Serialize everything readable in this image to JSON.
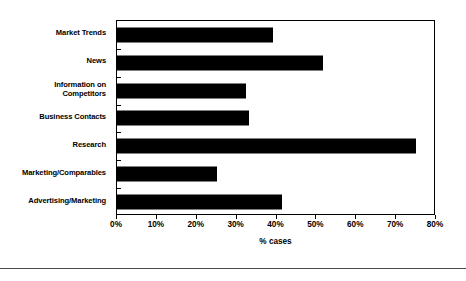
{
  "chart_data": {
    "type": "bar",
    "orientation": "horizontal",
    "title": "",
    "subtitle": "",
    "xlabel": "% cases",
    "ylabel": "",
    "xlim": [
      0,
      80
    ],
    "xtick_values": [
      0,
      10,
      20,
      30,
      40,
      50,
      60,
      70,
      80
    ],
    "xtick_labels": [
      "0%",
      "10%",
      "20%",
      "30%",
      "40%",
      "50%",
      "60%",
      "70%",
      "80%"
    ],
    "grid": false,
    "legend": null,
    "bar_color": "#000000",
    "frame_color": "#000000",
    "background_color": "#FFFFFF",
    "categories": [
      "Market Trends",
      "News",
      "Information on\nCompetitors",
      "Business Contacts",
      "Research",
      "Marketing/Comparables",
      "Advertising/Marketing"
    ],
    "values": [
      39,
      51.6,
      32.3,
      33.2,
      75,
      25.2,
      41.3
    ],
    "series": [
      {
        "name": "% cases",
        "values": [
          39,
          51.6,
          32.3,
          33.2,
          75,
          25.2,
          41.3
        ]
      }
    ],
    "points": [
      {
        "category": "Market Trends",
        "value": 39
      },
      {
        "category": "News",
        "value": 51.6
      },
      {
        "category": "Information on Competitors",
        "value": 32.3
      },
      {
        "category": "Business Contacts",
        "value": 33.2
      },
      {
        "category": "Research",
        "value": 75
      },
      {
        "category": "Marketing/Comparables",
        "value": 25.2
      },
      {
        "category": "Advertising/Marketing",
        "value": 41.3
      }
    ]
  }
}
